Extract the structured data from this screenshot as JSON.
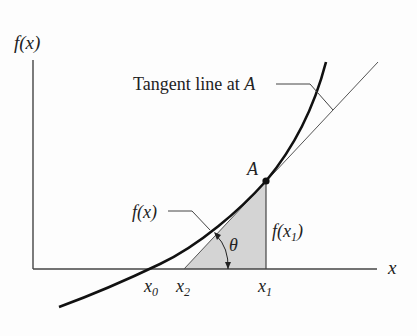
{
  "figure": {
    "y_axis_label": "f(x)",
    "x_axis_label": "x",
    "tangent_label": "Tangent line at ",
    "tangent_label_point": "A",
    "point_label": "A",
    "curve_label": "f(x)",
    "height_label_f": "f(x",
    "height_label_sub": "1",
    "height_label_close": ")",
    "angle_label": "θ",
    "ticks": [
      {
        "base": "x",
        "sub": "0"
      },
      {
        "base": "x",
        "sub": "2"
      },
      {
        "base": "x",
        "sub": "1"
      }
    ],
    "colors": {
      "ink": "#1a1a1a",
      "shade": "#d4d4d4"
    }
  }
}
